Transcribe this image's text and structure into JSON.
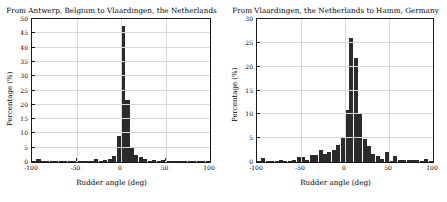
{
  "figure": {
    "panels": [
      "left",
      "right"
    ]
  },
  "chart_data": [
    {
      "type": "bar",
      "title": "From Antwerp, Belgium to Vlaardingen, the Netherlands",
      "xlabel": "Rudder angle (deg)",
      "ylabel": "Percentage (%)",
      "xlim": [
        -100,
        100
      ],
      "ylim": [
        0,
        50
      ],
      "xticks": [
        -100,
        -50,
        0,
        50,
        100
      ],
      "xtick_labels": [
        "-100",
        "-50",
        "0",
        "50",
        "100"
      ],
      "yticks": [
        0,
        5,
        10,
        15,
        20,
        25,
        30,
        35,
        40,
        45,
        50
      ],
      "ytick_labels": [
        "0",
        "5",
        "10",
        "15",
        "20",
        "25",
        "30",
        "35",
        "40",
        "45",
        "50"
      ],
      "grid": true,
      "bin_width": 5,
      "bar_color": "#2b2b2b",
      "categories": [
        -97.5,
        -92.5,
        -87.5,
        -82.5,
        -77.5,
        -72.5,
        -67.5,
        -62.5,
        -57.5,
        -52.5,
        -47.5,
        -42.5,
        -37.5,
        -32.5,
        -27.5,
        -22.5,
        -17.5,
        -12.5,
        -7.5,
        -2.5,
        2.5,
        7.5,
        12.5,
        17.5,
        22.5,
        27.5,
        32.5,
        37.5,
        42.5,
        47.5,
        52.5,
        57.5,
        62.5,
        67.5,
        72.5,
        77.5,
        82.5,
        87.5,
        92.5,
        97.5
      ],
      "values": [
        0.2,
        1.0,
        0.2,
        0.1,
        0.2,
        0.2,
        0.2,
        0.2,
        0.2,
        0.3,
        0.5,
        0.2,
        0.3,
        0.4,
        0.9,
        0.5,
        0.7,
        1.1,
        2.1,
        9.0,
        47.5,
        21.7,
        5.2,
        2.4,
        1.6,
        1.0,
        0.5,
        0.6,
        0.3,
        0.6,
        0.2,
        0.2,
        0.2,
        0.1,
        0.1,
        0.1,
        0.1,
        0.2,
        0.5,
        0.2
      ]
    },
    {
      "type": "bar",
      "title": "From Vlaardingen, the Netherlands to Hamm, Germany",
      "xlabel": "Rudder angle (deg)",
      "ylabel": "Percentage (%)",
      "xlim": [
        -100,
        100
      ],
      "ylim": [
        0,
        30
      ],
      "xticks": [
        -100,
        -50,
        0,
        50,
        100
      ],
      "xtick_labels": [
        "-100",
        "-50",
        "0",
        "50",
        "100"
      ],
      "yticks": [
        0,
        5,
        10,
        15,
        20,
        25,
        30
      ],
      "ytick_labels": [
        "0",
        "5",
        "10",
        "15",
        "20",
        "25",
        "30"
      ],
      "grid": true,
      "bin_width": 5,
      "bar_color": "#2b2b2b",
      "categories": [
        -97.5,
        -92.5,
        -87.5,
        -82.5,
        -77.5,
        -72.5,
        -67.5,
        -62.5,
        -57.5,
        -52.5,
        -47.5,
        -42.5,
        -37.5,
        -32.5,
        -27.5,
        -22.5,
        -17.5,
        -12.5,
        -7.5,
        -2.5,
        2.5,
        7.5,
        12.5,
        17.5,
        22.5,
        27.5,
        32.5,
        37.5,
        42.5,
        47.5,
        52.5,
        57.5,
        62.5,
        67.5,
        72.5,
        77.5,
        82.5,
        87.5,
        92.5,
        97.5
      ],
      "values": [
        0.2,
        0.8,
        0.2,
        0.2,
        0.3,
        0.5,
        0.3,
        0.3,
        0.4,
        1.1,
        1.1,
        0.4,
        1.4,
        1.4,
        2.6,
        1.7,
        2.1,
        2.6,
        3.6,
        5.2,
        11.0,
        26.1,
        21.9,
        10.0,
        4.8,
        3.4,
        1.6,
        1.2,
        0.7,
        2.0,
        0.3,
        1.3,
        0.5,
        0.5,
        0.4,
        0.4,
        0.5,
        0.3,
        0.7,
        0.2
      ]
    }
  ]
}
